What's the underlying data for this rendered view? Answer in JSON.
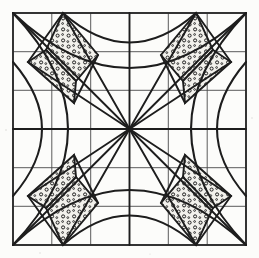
{
  "figure": {
    "colors": {
      "background": "#fcfcfa",
      "border": "#2a2a2a",
      "grid": "#4a4a4a",
      "curve": "#1d1d1d",
      "ray": "#1d1d1d",
      "shade_fill": "#f0efe9",
      "stipple": "#1d1d1d"
    },
    "frame": {
      "left": 13,
      "top": 13,
      "right": 246,
      "bottom": 245
    },
    "grid": {
      "columns": 6,
      "rows": 6,
      "show": true
    },
    "center": {
      "x": 129.5,
      "y": 129.0
    },
    "ray_count": 12,
    "arc_count": 4,
    "shaded_region_count": 8,
    "symmetry": "4-fold rotational (C4)"
  },
  "chart_data": {
    "type": "line",
    "xlabel": "",
    "ylabel": "",
    "xlim": [
      13,
      246
    ],
    "ylim": [
      13,
      245
    ],
    "grid": true,
    "legend": "none",
    "grid_x_ticks": [
      13,
      51.8,
      90.7,
      129.5,
      168.3,
      207.2,
      246
    ],
    "grid_y_ticks": [
      13,
      51.7,
      90.3,
      129.0,
      167.7,
      206.3,
      245
    ],
    "series": [
      {
        "name": "arc-top",
        "points": [
          [
            13,
            13
          ],
          [
            129.5,
            68
          ],
          [
            246,
            13
          ]
        ]
      },
      {
        "name": "arc-right",
        "points": [
          [
            246,
            13
          ],
          [
            191,
            129
          ],
          [
            246,
            245
          ]
        ]
      },
      {
        "name": "arc-bottom",
        "points": [
          [
            246,
            245
          ],
          [
            129.5,
            190
          ],
          [
            13,
            245
          ]
        ]
      },
      {
        "name": "arc-left",
        "points": [
          [
            13,
            245
          ],
          [
            68,
            129
          ],
          [
            13,
            13
          ]
        ]
      }
    ],
    "rays": [
      {
        "name": "ray-0",
        "angle_deg": 0,
        "to": [
          246,
          129
        ]
      },
      {
        "name": "ray-1",
        "angle_deg": 30,
        "to": [
          231,
          62
        ]
      },
      {
        "name": "ray-2",
        "angle_deg": 45,
        "to": [
          246,
          13
        ]
      },
      {
        "name": "ray-3",
        "angle_deg": 60,
        "to": [
          196,
          13
        ]
      },
      {
        "name": "ray-4",
        "angle_deg": 90,
        "to": [
          129.5,
          13
        ]
      },
      {
        "name": "ray-5",
        "angle_deg": 120,
        "to": [
          63,
          13
        ]
      },
      {
        "name": "ray-6",
        "angle_deg": 135,
        "to": [
          13,
          13
        ]
      },
      {
        "name": "ray-7",
        "angle_deg": 150,
        "to": [
          28,
          62
        ]
      },
      {
        "name": "ray-8",
        "angle_deg": 180,
        "to": [
          13,
          129
        ]
      },
      {
        "name": "ray-9",
        "angle_deg": 210,
        "to": [
          28,
          196
        ]
      },
      {
        "name": "ray-10",
        "angle_deg": 225,
        "to": [
          13,
          245
        ]
      },
      {
        "name": "ray-11",
        "angle_deg": 240,
        "to": [
          63,
          245
        ]
      },
      {
        "name": "ray-12",
        "angle_deg": 270,
        "to": [
          129.5,
          245
        ]
      },
      {
        "name": "ray-13",
        "angle_deg": 300,
        "to": [
          196,
          245
        ]
      },
      {
        "name": "ray-14",
        "angle_deg": 315,
        "to": [
          246,
          245
        ]
      },
      {
        "name": "ray-15",
        "angle_deg": 330,
        "to": [
          231,
          196
        ]
      }
    ]
  }
}
